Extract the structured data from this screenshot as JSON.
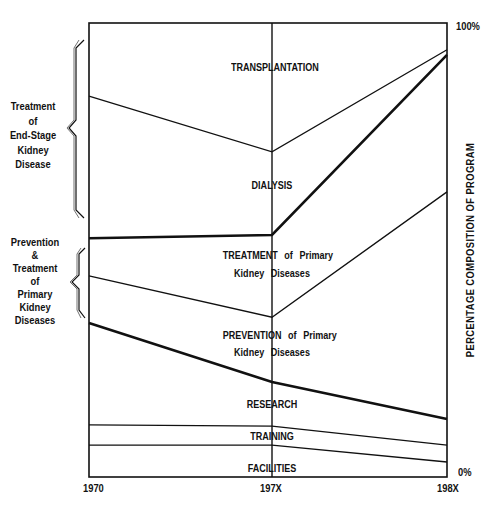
{
  "chart_data": {
    "type": "area",
    "stacked": true,
    "title": "",
    "xlabel": "",
    "ylabel": "PERCENTAGE COMPOSITION OF PROGRAM",
    "x": [
      "1970",
      "197X",
      "198X"
    ],
    "ylim": [
      0,
      100
    ],
    "y_tick_labels": {
      "top": "100%",
      "bottom": "0%"
    },
    "grid": false,
    "boundaries_percent": [
      {
        "name": "Training/Research boundary",
        "values": [
          11.5,
          11.2,
          7.0
        ],
        "weight": "thin"
      },
      {
        "name": "Facilities/Training boundary",
        "values": [
          7.0,
          7.0,
          3.3
        ],
        "weight": "thin"
      },
      {
        "name": "Research/Prevention boundary",
        "values": [
          33.9,
          20.9,
          12.8
        ],
        "weight": "thick"
      },
      {
        "name": "Prevention/Treatment of Primary boundary",
        "values": [
          44.3,
          35.2,
          62.8
        ],
        "weight": "thin"
      },
      {
        "name": "Primary/End-Stage boundary",
        "values": [
          52.6,
          53.3,
          93.0
        ],
        "weight": "thick"
      },
      {
        "name": "Dialysis/Transplantation boundary",
        "values": [
          83.9,
          71.6,
          94.1
        ],
        "weight": "thin"
      }
    ],
    "series": [
      {
        "name": "FACILITIES",
        "values": [
          7.0,
          7.0,
          3.3
        ]
      },
      {
        "name": "TRAINING",
        "values": [
          4.5,
          4.2,
          3.7
        ]
      },
      {
        "name": "RESEARCH",
        "values": [
          22.4,
          9.7,
          5.8
        ]
      },
      {
        "name": "PREVENTION of Primary Kidney Diseases",
        "values": [
          10.4,
          14.3,
          50.0
        ]
      },
      {
        "name": "TREATMENT of Primary Kidney Diseases",
        "values": [
          8.3,
          18.1,
          30.2
        ]
      },
      {
        "name": "DIALYSIS",
        "values": [
          31.3,
          18.3,
          1.1
        ]
      },
      {
        "name": "TRANSPLANTATION",
        "values": [
          16.1,
          28.4,
          5.9
        ]
      }
    ],
    "region_labels": [
      "TRANSPLANTATION",
      "DIALYSIS",
      "TREATMENT of Primary Kidney Diseases",
      "PREVENTION of Primary Kidney Diseases",
      "RESEARCH",
      "TRAINING",
      "FACILITIES"
    ],
    "bracket_groups": [
      {
        "label": "Treatment of End-Stage Kidney Disease",
        "covers": [
          "TRANSPLANTATION",
          "DIALYSIS"
        ]
      },
      {
        "label": "Prevention & Treatment of Primary Kidney Diseases",
        "covers": [
          "TREATMENT of Primary Kidney Diseases",
          "PREVENTION of Primary Kidney Diseases"
        ]
      }
    ]
  },
  "labels": {
    "transplantation": "TRANSPLANTATION",
    "dialysis": "DIALYSIS",
    "treatment_line1": "TREATMENT of Primary",
    "treatment_line2": "Kidney Diseases",
    "prevention_line1": "PREVENTION of Primary",
    "prevention_line2": "Kidney Diseases",
    "research": "RESEARCH",
    "training": "TRAINING",
    "facilities": "FACILITIES"
  },
  "groups": {
    "end_stage": [
      "Treatment",
      "of",
      "End-Stage",
      "Kidney",
      "Disease"
    ],
    "primary": [
      "Prevention",
      "&",
      "Treatment",
      "of",
      "Primary",
      "Kidney",
      "Diseases"
    ]
  },
  "axes": {
    "x_ticks": [
      "1970",
      "197X",
      "198X"
    ],
    "y_top": "100%",
    "y_bottom": "0%",
    "y_title": "PERCENTAGE COMPOSITION OF PROGRAM"
  }
}
